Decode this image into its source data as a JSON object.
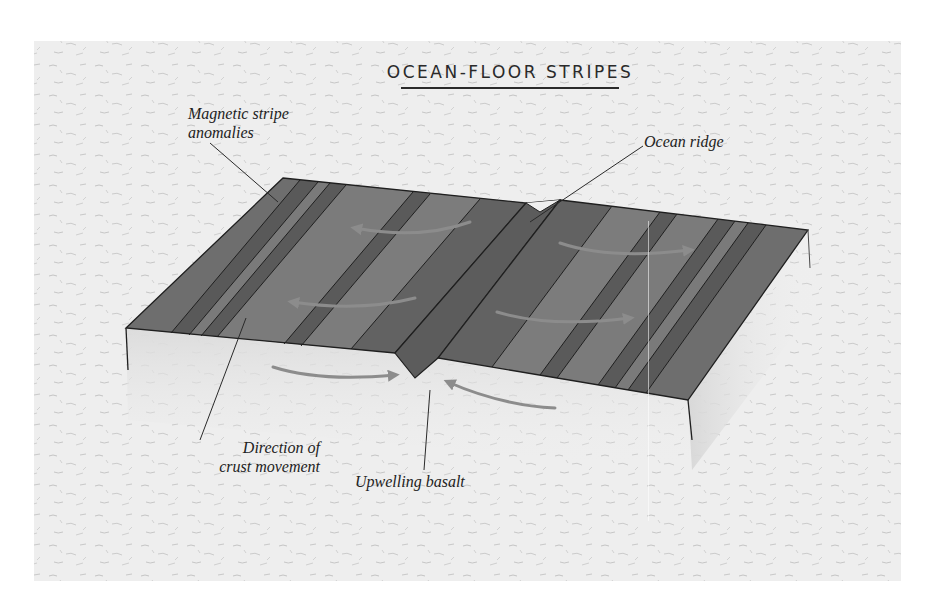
{
  "title": "OCEAN-FLOOR STRIPES",
  "labels": {
    "magnetic_line1": "Magnetic stripe",
    "magnetic_line2": "anomalies",
    "ocean_ridge": "Ocean ridge",
    "direction_line1": "Direction of",
    "direction_line2": "crust movement",
    "upwelling": "Upwelling basalt"
  },
  "colors": {
    "background_panel": "#ececec",
    "page": "#ffffff",
    "stripe_dark": "#5a5a5a",
    "stripe_light": "#7b7b7b",
    "ridge_center": "#585858",
    "outline": "#1f1f1f",
    "arrow": "#8c8c8c",
    "text": "#222222"
  },
  "diagram": {
    "type": "block-diagram",
    "parts": [
      "left crustal block",
      "right crustal block",
      "ocean ridge notch",
      "upwelling basalt",
      "crust movement arrows"
    ]
  }
}
